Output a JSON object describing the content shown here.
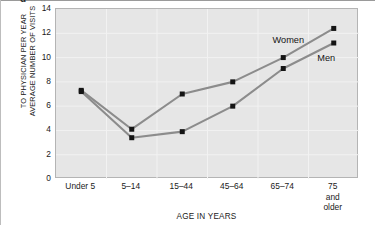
{
  "figure": {
    "clipped_marker": "d",
    "ytitle_lines": [
      "AVERAGE NUMBER OF VISITS",
      "TO PHYSICIAN PER YEAR"
    ],
    "xtitle": "AGE IN YEARS"
  },
  "colors": {
    "plot_background": "#e6e6e6",
    "gridline": "#f2f2f2",
    "plot_border": "#b4b4b4",
    "series_line": "#8c8c8c",
    "marker": "#141414",
    "text": "#1a1a1a"
  },
  "chart_data": {
    "type": "line",
    "title": "",
    "subtitle": "",
    "xlabel": "AGE IN YEARS",
    "ylabel": "AVERAGE NUMBER OF VISITS TO PHYSICIAN PER YEAR",
    "categories": [
      "Under 5",
      "5–14",
      "15–44",
      "45–64",
      "65–74",
      "75 and\nolder"
    ],
    "ylim": [
      0,
      14
    ],
    "yticks": [
      0,
      2,
      4,
      6,
      8,
      10,
      12,
      14
    ],
    "ytick_labels": [
      "0",
      "2",
      "4",
      "6",
      "8",
      "10",
      "12",
      "14"
    ],
    "grid": true,
    "legend_position": "inline-annotations",
    "series": [
      {
        "name": "Women",
        "values": [
          7.3,
          4.1,
          7.0,
          8.0,
          10.0,
          12.4
        ],
        "marker": "square",
        "label_anchor_category": "65–74"
      },
      {
        "name": "Men",
        "values": [
          7.2,
          3.4,
          3.9,
          6.0,
          9.1,
          11.2
        ],
        "marker": "square",
        "label_anchor_category": "75 and\nolder"
      }
    ],
    "annotations": [
      {
        "text": "Women",
        "x_frac": 0.77,
        "y_value": 11.35
      },
      {
        "text": "Men",
        "x_frac": 0.895,
        "y_value": 9.9
      }
    ]
  }
}
